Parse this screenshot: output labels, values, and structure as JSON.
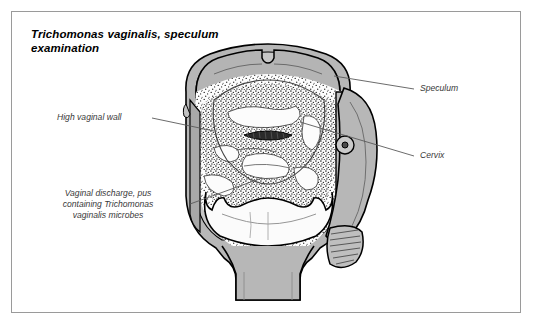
{
  "figure": {
    "title": "Trichomonas vaginalis,\nspeculum examination",
    "kind": "medical-illustration",
    "border_color": "#9a9a9a",
    "background_color": "#ffffff"
  },
  "labels": {
    "speculum": "Speculum",
    "cervix": "Cervix",
    "high_vaginal_wall": "High vaginal wall",
    "discharge": "Vaginal discharge, pus\ncontaining Trichomonas\nvaginalis microbes"
  },
  "colors": {
    "outline": "#000000",
    "metal_gray": "#b7b7b7",
    "metal_gray_dark": "#9d9d9d",
    "metal_gray_light": "#cfcfcf",
    "tissue_white": "#fbfbfb",
    "stipple": "#2b2b2b",
    "leader_line": "#5a5a5a",
    "label_text": "#3a3a3a"
  },
  "parts": [
    {
      "name": "upper-speculum-blade",
      "fill": "metal_gray"
    },
    {
      "name": "lower-speculum-blade",
      "fill": "tissue_white"
    },
    {
      "name": "speculum-handle",
      "fill": "metal_gray"
    },
    {
      "name": "speculum-pivot-screw",
      "fill": "metal_gray_light"
    },
    {
      "name": "speculum-grip-ribs",
      "count": 9
    },
    {
      "name": "cervix",
      "fill": "tissue_white"
    },
    {
      "name": "cervical-os",
      "fill": "stipple"
    },
    {
      "name": "vaginal-wall",
      "fill": "tissue_white"
    },
    {
      "name": "discharge-stipple-field",
      "fill": "stipple"
    }
  ]
}
